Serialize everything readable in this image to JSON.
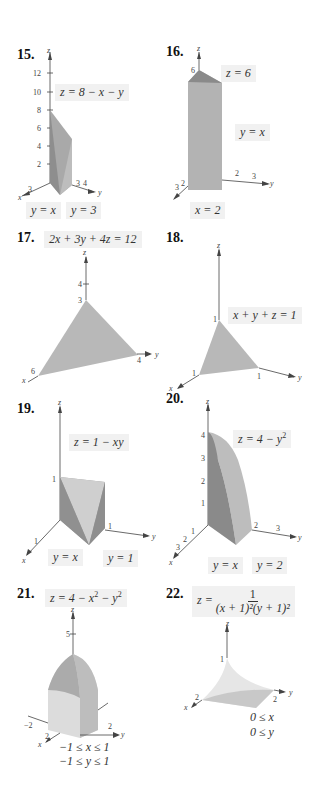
{
  "figures": [
    {
      "number": "15.",
      "equation": "z = 8 − x − y",
      "boundaries": [
        "y = x",
        "y = 3"
      ],
      "z_ticks": [
        "2",
        "4",
        "6",
        "8",
        "10",
        "12"
      ],
      "x_ticks": [
        "3"
      ],
      "y_ticks": [
        "3",
        "4"
      ],
      "axes": [
        "x",
        "y",
        "z"
      ]
    },
    {
      "number": "16.",
      "equation": "z = 6",
      "boundaries": [
        "y = x",
        "x = 2"
      ],
      "z_ticks": [
        "6"
      ],
      "x_ticks": [
        "2",
        "3"
      ],
      "y_ticks": [
        "2",
        "3"
      ],
      "axes": [
        "x",
        "y",
        "z"
      ]
    },
    {
      "number": "17.",
      "equation": "2x + 3y + 4z = 12",
      "z_ticks": [
        "3",
        "4"
      ],
      "x_ticks": [
        "6"
      ],
      "y_ticks": [
        "4"
      ],
      "axes": [
        "x",
        "y",
        "z"
      ]
    },
    {
      "number": "18.",
      "equation": "x + y + z = 1",
      "z_ticks": [
        "1"
      ],
      "x_ticks": [
        "1"
      ],
      "y_ticks": [
        "1"
      ],
      "axes": [
        "x",
        "y",
        "z"
      ]
    },
    {
      "number": "19.",
      "equation": "z = 1 − xy",
      "boundaries": [
        "y = x",
        "y = 1"
      ],
      "z_ticks": [
        "1"
      ],
      "x_ticks": [
        "1"
      ],
      "y_ticks": [
        "1"
      ],
      "axes": [
        "x",
        "y",
        "z"
      ]
    },
    {
      "number": "20.",
      "equation_base": "z = 4 − y",
      "equation_exp": "2",
      "boundaries": [
        "y = x",
        "y = 2"
      ],
      "z_ticks": [
        "1",
        "2",
        "3",
        "4"
      ],
      "x_ticks": [
        "1",
        "2",
        "3"
      ],
      "y_ticks": [
        "2",
        "3"
      ],
      "axes": [
        "x",
        "y",
        "z"
      ]
    },
    {
      "number": "21.",
      "equation_parts": [
        "z = 4 − x",
        "2",
        " − y",
        "2"
      ],
      "constraints": [
        "−1 ≤ x ≤ 1",
        "−1 ≤ y ≤ 1"
      ],
      "z_ticks": [
        "5"
      ],
      "x_ticks": [
        "2"
      ],
      "y_ticks": [
        "−2",
        "2"
      ],
      "axes": [
        "x",
        "y",
        "z"
      ]
    },
    {
      "number": "22.",
      "equation_lhs": "z =",
      "equation_num": "1",
      "equation_den": "(x + 1)²(y + 1)²",
      "constraints": [
        "0 ≤ x",
        "0 ≤ y"
      ],
      "z_ticks": [
        "1"
      ],
      "x_ticks": [
        "2"
      ],
      "y_ticks": [
        "2"
      ],
      "axes": [
        "x",
        "y",
        "z"
      ]
    }
  ]
}
